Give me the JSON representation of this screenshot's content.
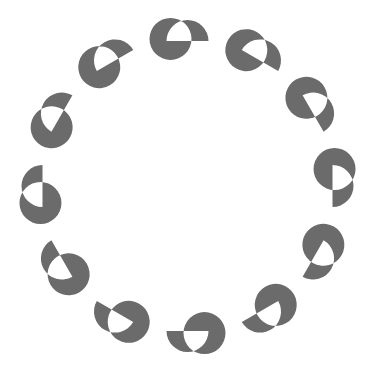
{
  "graphic": {
    "kind": "loading-spinner",
    "title": "Loading spinner",
    "description": "Twelve crescent segments arranged evenly around a circle",
    "canvas": {
      "width": 375,
      "height": 372,
      "background_color": "#ffffff"
    },
    "ring": {
      "center_x": 187.5,
      "center_y": 186,
      "radius": 145,
      "segment_count": 12,
      "start_angle_deg": -90,
      "angle_step_deg": 30
    },
    "segment": {
      "shape": "half-disc-with-concave-bite",
      "fill_color": "#6b6b6b",
      "outer_radius": 21,
      "bite_radius": 21,
      "bite_offset": 17,
      "opacity": 1
    },
    "segments": [
      {
        "index": 0,
        "label": "segment-1",
        "angle_deg": -90,
        "center_x": 187.5,
        "center_y": 41.0
      },
      {
        "index": 1,
        "label": "segment-2",
        "angle_deg": -60,
        "center_x": 260.0,
        "center_y": 60.4
      },
      {
        "index": 2,
        "label": "segment-3",
        "angle_deg": -30,
        "center_x": 313.1,
        "center_y": 113.5
      },
      {
        "index": 3,
        "label": "segment-4",
        "angle_deg": 0,
        "center_x": 332.5,
        "center_y": 186.0
      },
      {
        "index": 4,
        "label": "segment-5",
        "angle_deg": 30,
        "center_x": 313.1,
        "center_y": 258.5
      },
      {
        "index": 5,
        "label": "segment-6",
        "angle_deg": 60,
        "center_x": 260.0,
        "center_y": 311.6
      },
      {
        "index": 6,
        "label": "segment-7",
        "angle_deg": 90,
        "center_x": 187.5,
        "center_y": 331.0
      },
      {
        "index": 7,
        "label": "segment-8",
        "angle_deg": 120,
        "center_x": 115.0,
        "center_y": 311.6
      },
      {
        "index": 8,
        "label": "segment-9",
        "angle_deg": 150,
        "center_x": 61.9,
        "center_y": 258.5
      },
      {
        "index": 9,
        "label": "segment-10",
        "angle_deg": 180,
        "center_x": 42.5,
        "center_y": 186.0
      },
      {
        "index": 10,
        "label": "segment-11",
        "angle_deg": 210,
        "center_x": 61.9,
        "center_y": 113.5
      },
      {
        "index": 11,
        "label": "segment-12",
        "angle_deg": 240,
        "center_x": 115.0,
        "center_y": 60.4
      }
    ]
  }
}
